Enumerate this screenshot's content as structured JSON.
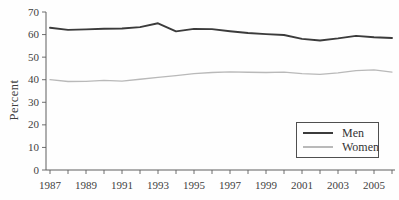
{
  "chart_data": {
    "type": "line",
    "title": "",
    "xlabel": "",
    "ylabel": "Percent",
    "ylim": [
      0,
      70
    ],
    "y_ticks": [
      0,
      10,
      20,
      30,
      40,
      50,
      60,
      70
    ],
    "grid": false,
    "legend_position": "bottom-right",
    "x": [
      1987,
      1988,
      1989,
      1990,
      1991,
      1992,
      1993,
      1994,
      1995,
      1996,
      1997,
      1998,
      1999,
      2000,
      2001,
      2002,
      2003,
      2004,
      2005,
      2006
    ],
    "x_tick_labels": [
      "1987",
      "1989",
      "1991",
      "1993",
      "1995",
      "1997",
      "1999",
      "2001",
      "2003",
      "2005"
    ],
    "series": [
      {
        "name": "Men",
        "color": "#3b3b3b",
        "stroke_width": 1.9,
        "values": [
          63.0,
          62.1,
          62.3,
          62.6,
          62.7,
          63.3,
          65.0,
          61.4,
          62.5,
          62.4,
          61.5,
          60.7,
          60.2,
          59.8,
          58.1,
          57.4,
          58.3,
          59.4,
          58.8,
          58.5
        ]
      },
      {
        "name": "Women",
        "color": "#b9b9b9",
        "stroke_width": 1.3,
        "values": [
          40.0,
          39.2,
          39.3,
          39.7,
          39.4,
          40.2,
          41.0,
          41.8,
          42.7,
          43.2,
          43.5,
          43.3,
          43.2,
          43.4,
          42.7,
          42.4,
          43.0,
          44.0,
          44.4,
          43.4
        ]
      }
    ]
  }
}
